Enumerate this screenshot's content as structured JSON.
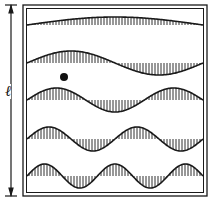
{
  "figure": {
    "type": "standing-wave-modes",
    "length_label": "ℓ",
    "colors": {
      "ink": "#1a1a1a",
      "paper": "#ffffff"
    },
    "modes": [
      {
        "n": 1,
        "center_y": 25,
        "amplitude": 8
      },
      {
        "n": 2,
        "center_y": 63,
        "amplitude": 12
      },
      {
        "n": 3,
        "center_y": 100,
        "amplitude": 12
      },
      {
        "n": 4,
        "center_y": 139,
        "amplitude": 12
      },
      {
        "n": 5,
        "center_y": 176,
        "amplitude": 12
      }
    ],
    "dot": {
      "x": 64,
      "y": 77
    }
  }
}
